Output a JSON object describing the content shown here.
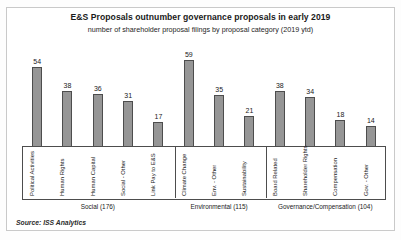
{
  "header": {
    "title": "E&S Proposals outnumber governance proposals in early 2019",
    "subtitle": "number of shareholder proposal filings by proposal category (2019 ytd)"
  },
  "footer": {
    "source": "Source: ISS Analytics"
  },
  "colors": {
    "bar_fill": "#969696",
    "bar_stroke": "#4d4d4d",
    "text": "#1a1a1a",
    "frame": "#c9c9c9"
  },
  "groups": [
    {
      "label": "Social (176)",
      "total": 176,
      "count": 5
    },
    {
      "label": "Environmental (115)",
      "total": 115,
      "count": 3
    },
    {
      "label": "Governance/Compensation (104)",
      "total": 104,
      "count": 4
    }
  ],
  "chart_data": {
    "type": "bar",
    "title": "E&S Proposals outnumber governance proposals in early 2019",
    "subtitle": "number of shareholder proposal filings by proposal category (2019 ytd)",
    "xlabel": "",
    "ylabel": "number of shareholder proposal filings",
    "ylim": [
      0,
      59
    ],
    "grid": false,
    "legend": "none",
    "source": "Source: ISS Analytics",
    "categories": [
      "Political Activities",
      "Human Rights",
      "Human Capital",
      "Social - Other",
      "Link Pay to E&S",
      "Climate Change",
      "Env. - Other",
      "Sustainability",
      "Board Related",
      "Shareholder Rights",
      "Compensation",
      "Gov. - Other"
    ],
    "values": [
      54,
      38,
      36,
      31,
      17,
      59,
      35,
      21,
      38,
      34,
      18,
      14
    ],
    "group_of_category": [
      "Social",
      "Social",
      "Social",
      "Social",
      "Social",
      "Environmental",
      "Environmental",
      "Environmental",
      "Governance/Compensation",
      "Governance/Compensation",
      "Governance/Compensation",
      "Governance/Compensation"
    ],
    "group_totals": {
      "Social (176)": 176,
      "Environmental (115)": 115,
      "Governance/Compensation (104)": 104
    }
  }
}
